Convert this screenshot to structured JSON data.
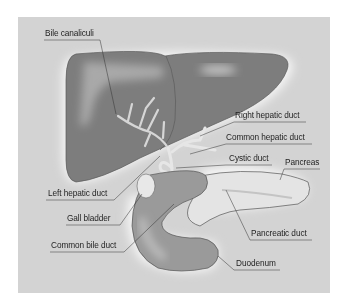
{
  "figure": {
    "colors": {
      "panel_background": "#d3d3d3",
      "liver": "#7d7d7d",
      "liver_highlight": "#a9a9a9",
      "ducts": "#e6e6e6",
      "pancreas": "#e4e4e4",
      "duodenum": "#9a9a9a",
      "leader_line": "#333333",
      "label_text": "#1e1e1e"
    },
    "labels": {
      "bile_canaliculi": "Bile canaliculi",
      "right_hepatic_duct": "Right hepatic duct",
      "common_hepatic_duct": "Common hepatic duct",
      "cystic_duct": "Cystic duct",
      "pancreas": "Pancreas",
      "left_hepatic_duct": "Left hepatic duct",
      "gall_bladder": "Gall bladder",
      "common_bile_duct": "Common bile duct",
      "pancreatic_duct": "Pancreatic duct",
      "duodenum": "Duodenum"
    }
  }
}
